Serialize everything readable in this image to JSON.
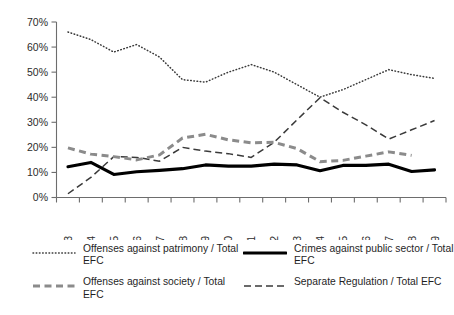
{
  "chart_data": {
    "type": "line",
    "title": "",
    "xlabel": "",
    "ylabel": "",
    "x": [
      1993,
      1994,
      1995,
      1996,
      1997,
      1998,
      1999,
      2000,
      2001,
      2002,
      2003,
      2004,
      2005,
      2006,
      2007,
      2008,
      2009
    ],
    "categories": [
      "1993",
      "1994",
      "1995",
      "1996",
      "1997",
      "1998",
      "1999",
      "2000",
      "2001",
      "2002",
      "2003",
      "2004",
      "2005",
      "2006",
      "2007",
      "2008",
      "2009"
    ],
    "ylim": [
      0,
      70
    ],
    "ytick_values": [
      0,
      10,
      20,
      30,
      40,
      50,
      60,
      70
    ],
    "ytick_labels": [
      "0%",
      "10%",
      "20%",
      "30%",
      "40%",
      "50%",
      "60%",
      "70%"
    ],
    "grid": false,
    "legend_position": "below",
    "series": [
      {
        "name": "Offenses against patrimony / Total EFC",
        "style": "dotted",
        "color": "#3a3a3a",
        "values": [
          66.0,
          63.0,
          58.0,
          61.0,
          56.0,
          47.0,
          46.0,
          50.0,
          53.0,
          50.0,
          45.0,
          40.0,
          43.0,
          47.0,
          51.0,
          49.0,
          47.5
        ]
      },
      {
        "name": "Crimes against public sector / Total EFC",
        "style": "solid-thick",
        "color": "#000000",
        "values": [
          12.3,
          14.0,
          9.2,
          10.3,
          10.8,
          11.5,
          13.0,
          12.5,
          12.5,
          13.3,
          13.0,
          10.7,
          12.8,
          12.8,
          13.3,
          10.4,
          11.0
        ]
      },
      {
        "name": "Offenses against society / Total EFC",
        "style": "dashed-thick",
        "color": "#8b8b8b",
        "values": [
          19.8,
          17.3,
          16.3,
          15.0,
          17.0,
          23.7,
          25.2,
          23.0,
          21.8,
          22.0,
          19.5,
          14.3,
          14.8,
          16.5,
          18.2,
          16.8,
          null
        ]
      },
      {
        "name": "Separate Regulation / Total EFC",
        "style": "dashed-thin",
        "color": "#3a3a3a",
        "values": [
          1.5,
          8.0,
          16.3,
          16.0,
          14.5,
          20.0,
          18.5,
          17.5,
          16.0,
          22.0,
          31.0,
          39.8,
          34.0,
          29.0,
          23.3,
          27.0,
          30.7
        ]
      }
    ]
  },
  "legend": {
    "items": [
      {
        "label": "Offenses against patrimony / Total EFC",
        "style": "dotted",
        "column": "left"
      },
      {
        "label": "Crimes against public sector / Total EFC",
        "style": "solid-thick",
        "column": "right"
      },
      {
        "label": "Offenses against society / Total EFC",
        "style": "dashed-thick",
        "column": "left"
      },
      {
        "label": "Separate Regulation / Total EFC",
        "style": "dashed-thin",
        "column": "right"
      }
    ]
  }
}
